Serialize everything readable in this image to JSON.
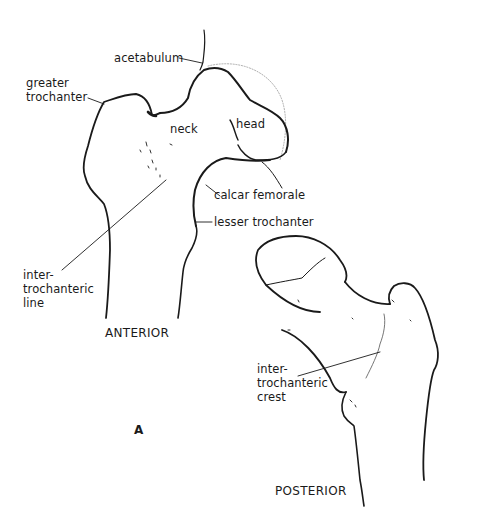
{
  "figure": {
    "panel_letter": "A",
    "views": {
      "anterior": "ANTERIOR",
      "posterior": "POSTERIOR"
    },
    "labels": {
      "acetabulum": "acetabulum",
      "greater_trochanter": "greater\ntrochanter",
      "neck": "neck",
      "head": "head",
      "calcar_femorale": "calcar femorale",
      "lesser_trochanter": "lesser trochanter",
      "intertrochanteric_line": "inter-\ntrochanteric\nline",
      "intertrochanteric_crest": "inter-\ntrochanteric\ncrest"
    },
    "colors": {
      "ink": "#1a1a1a",
      "background": "#ffffff"
    }
  }
}
